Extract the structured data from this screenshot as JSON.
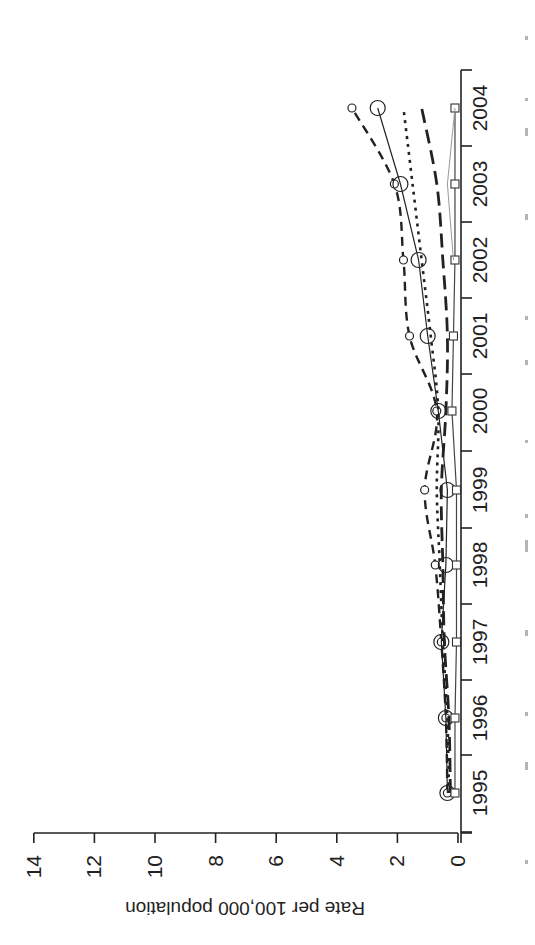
{
  "chart_data": {
    "type": "line",
    "orientation_note": "figure rendered rotated 90 degrees clockwise",
    "title": "",
    "xlabel": "",
    "ylabel": "Rate per 100,000 population",
    "x": [
      1995,
      1996,
      1997,
      1998,
      1999,
      2000,
      2001,
      2002,
      2003,
      2004
    ],
    "x_tick_labels": [
      "1995",
      "1996",
      "1997",
      "1998",
      "1999",
      "2000",
      "2001",
      "2002",
      "2003",
      "2004"
    ],
    "y_ticks": [
      0,
      2,
      4,
      6,
      8,
      10,
      12,
      14
    ],
    "y_tick_labels": [
      "0",
      "2",
      "4",
      "6",
      "8",
      "10",
      "12",
      "14"
    ],
    "ylim": [
      0,
      14
    ],
    "grid": false,
    "legend": null,
    "series": [
      {
        "name": "Series A (dashed, small circles)",
        "style": "dashed",
        "marker": "small-circle",
        "values": [
          0.35,
          0.4,
          0.55,
          0.75,
          1.1,
          0.7,
          1.6,
          1.8,
          2.1,
          3.5
        ]
      },
      {
        "name": "Series B (solid, large circles)",
        "style": "solid",
        "marker": "large-circle",
        "values": [
          0.35,
          0.4,
          0.55,
          0.4,
          0.35,
          0.65,
          1.0,
          1.3,
          1.9,
          2.65
        ]
      },
      {
        "name": "Series C (dotted)",
        "style": "dotted",
        "marker": "none",
        "values": [
          0.3,
          0.35,
          0.5,
          0.6,
          0.7,
          0.65,
          0.9,
          1.2,
          1.5,
          1.8
        ]
      },
      {
        "name": "Series D (long dashed)",
        "style": "longdash",
        "marker": "none",
        "values": [
          0.25,
          0.3,
          0.45,
          0.5,
          0.55,
          0.4,
          0.35,
          0.5,
          0.7,
          1.2
        ]
      },
      {
        "name": "Series E (solid, squares)",
        "style": "solid-thin",
        "marker": "square",
        "values": [
          0.1,
          0.1,
          0.05,
          0.05,
          0.05,
          0.2,
          0.15,
          0.1,
          0.1,
          0.1
        ]
      }
    ]
  },
  "layout": {
    "value_axis": {
      "zero_px": 458,
      "px_per_unit": 30.3,
      "line_y": 833,
      "x_start": 34,
      "x_end": 472
    },
    "year_axis": {
      "line_x": 461,
      "y_top": 70,
      "y_bottom": 843,
      "year_px": [
        793,
        718,
        642,
        565,
        490,
        411,
        336,
        260,
        184,
        108
      ],
      "bin_ticks_px": [
        832,
        755,
        680,
        604,
        528,
        451,
        374,
        298,
        222,
        146,
        70
      ]
    }
  }
}
